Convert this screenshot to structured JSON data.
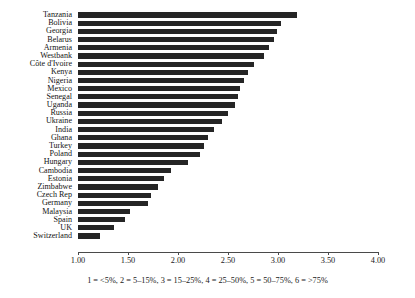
{
  "chart_data": {
    "type": "bar",
    "orientation": "horizontal",
    "title": "",
    "xlabel": "",
    "ylabel": "",
    "xlim": [
      1.0,
      4.2
    ],
    "grid": false,
    "legend": null,
    "caption": "1 = <5%, 2 = 5–15%, 3 = 15–25%, 4 = 25–50%, 5 = 50–75%, 6 = >75%",
    "xticks": [
      "1.00",
      "1.50",
      "2.00",
      "2.50",
      "3.00",
      "3.50",
      "4.00"
    ],
    "xtick_values": [
      1.0,
      1.5,
      2.0,
      2.5,
      3.0,
      3.5,
      4.0
    ],
    "categories": [
      "Tanzania",
      "Bolivia",
      "Georgia",
      "Belarus",
      "Armenia",
      "Westbank",
      "Côte d'Ivoire",
      "Kenya",
      "Nigeria",
      "Mexico",
      "Senegal",
      "Uganda",
      "Russia",
      "Ukraine",
      "India",
      "Ghana",
      "Turkey",
      "Poland",
      "Hungary",
      "Cambodia",
      "Estonia",
      "Zimbabwe",
      "Czech Rep",
      "Germany",
      "Malaysia",
      "Spain",
      "UK",
      "Switzerland"
    ],
    "values": [
      3.19,
      3.03,
      2.99,
      2.96,
      2.91,
      2.86,
      2.76,
      2.7,
      2.66,
      2.62,
      2.6,
      2.57,
      2.5,
      2.44,
      2.36,
      2.3,
      2.26,
      2.22,
      2.1,
      1.93,
      1.86,
      1.8,
      1.73,
      1.7,
      1.52,
      1.47,
      1.36,
      1.22
    ]
  }
}
